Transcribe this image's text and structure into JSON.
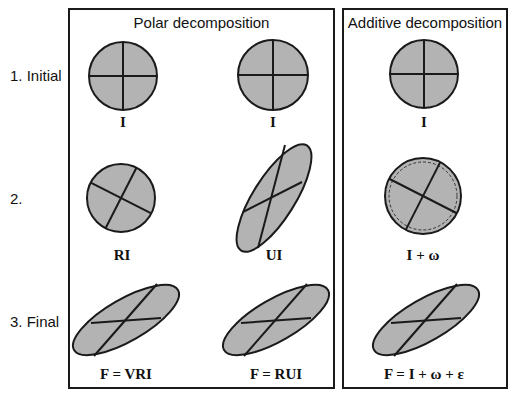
{
  "panels": {
    "polar": {
      "title": "Polar decomposition"
    },
    "additive": {
      "title": "Additive decomposition"
    }
  },
  "rows": [
    {
      "label": "1. Initial"
    },
    {
      "label": "2."
    },
    {
      "label": "3. Final"
    }
  ],
  "shapes": {
    "r1c1": {
      "label": "I",
      "type": "circle"
    },
    "r1c2": {
      "label": "I",
      "type": "circle"
    },
    "r1c3": {
      "label": "I",
      "type": "circle"
    },
    "r2c1": {
      "label": "RI",
      "type": "rotated-circle"
    },
    "r2c2": {
      "label": "UI",
      "type": "stretched-ellipse"
    },
    "r2c3": {
      "label": "I + ω",
      "type": "circle-with-dashed-reference"
    },
    "r3c1": {
      "label": "F = VRI",
      "type": "ellipse"
    },
    "r3c2": {
      "label": "F = RUI",
      "type": "ellipse"
    },
    "r3c3": {
      "label": "F = I + ω + ε",
      "type": "ellipse"
    }
  },
  "colors": {
    "shape_fill": "#b3b3b3",
    "stroke": "#1a1a1a",
    "background": "#ffffff"
  }
}
